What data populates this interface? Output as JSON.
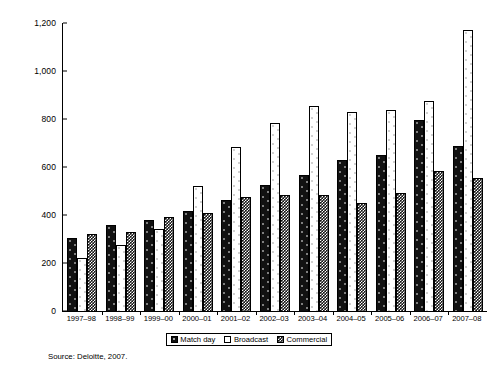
{
  "chart_data": {
    "type": "bar",
    "title": "",
    "subtitle": "",
    "xlabel": "",
    "ylabel": "",
    "ylim": [
      0,
      1200
    ],
    "yticks": [
      0,
      200,
      400,
      600,
      800,
      1000,
      1200
    ],
    "ytick_labels": [
      "0",
      "200",
      "400",
      "600",
      "800",
      "1,000",
      "1,200"
    ],
    "grid": false,
    "legend_position": "bottom-center",
    "categories": [
      "1997–98",
      "1998–99",
      "1999–00",
      "2000–01",
      "2001–02",
      "2002–03",
      "2003–04",
      "2004–05",
      "2005–06",
      "2006–07",
      "2007–08"
    ],
    "series": [
      {
        "name": "Match day",
        "pattern": "dark-dotted",
        "values": [
          303,
          357,
          378,
          418,
          462,
          525,
          566,
          628,
          650,
          796,
          687
        ]
      },
      {
        "name": "Broadcast",
        "pattern": "white-dotted",
        "values": [
          219,
          277,
          343,
          520,
          685,
          783,
          855,
          831,
          838,
          874,
          1170
        ]
      },
      {
        "name": "Commercial",
        "pattern": "dark-checkered",
        "values": [
          320,
          330,
          390,
          409,
          477,
          485,
          483,
          450,
          490,
          583,
          554
        ]
      }
    ],
    "annotations": [
      "Source: Deloitte, 2007."
    ]
  },
  "legend": {
    "items": [
      {
        "label": "Match day"
      },
      {
        "label": "Broadcast"
      },
      {
        "label": "Commercial"
      }
    ]
  },
  "source": {
    "text": "Source: Deloitte, 2007."
  }
}
